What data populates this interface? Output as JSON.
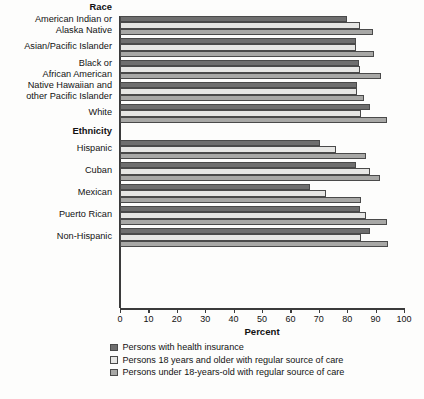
{
  "chart_data": {
    "type": "bar",
    "orientation": "horizontal",
    "title": "",
    "xlabel": "Percent",
    "ylabel": "",
    "xlim": [
      0,
      100
    ],
    "xticks": [
      0,
      10,
      20,
      30,
      40,
      50,
      60,
      70,
      80,
      90,
      100
    ],
    "grid": false,
    "legend_position": "bottom-left",
    "section_headers": [
      "Race",
      "Ethnicity"
    ],
    "categories": [
      "American Indian or\nAlaska Native",
      "Asian/Pacific Islander",
      "Black or\nAfrican American",
      "Native Hawaiian and\nother Pacific Islander",
      "White",
      "Hispanic",
      "Cuban",
      "Mexican",
      "Puerto Rican",
      "Non-Hispanic"
    ],
    "series": [
      {
        "name": "Persons with health insurance",
        "color": "#6e6e6e",
        "values": [
          80,
          83,
          84,
          83.5,
          88,
          70.5,
          83,
          67,
          84.5,
          88
        ]
      },
      {
        "name": "Persons 18 years and older with regular source of care",
        "color": "#e6e6e4",
        "values": [
          84.5,
          83,
          84.5,
          83.5,
          85,
          76,
          88,
          72.5,
          86.5,
          85
        ]
      },
      {
        "name": "Persons under 18-years-old with regular source of care",
        "color": "#a8a8a6",
        "values": [
          89,
          89.5,
          92,
          86,
          94,
          86.5,
          91.5,
          85,
          94,
          94.5
        ]
      }
    ]
  },
  "sections": [
    {
      "header": "Race",
      "rows": [
        {
          "label": "American Indian or\nAlaska Native"
        },
        {
          "label": "Asian/Pacific Islander"
        },
        {
          "label": "Black or\nAfrican American"
        },
        {
          "label": "Native Hawaiian and\nother Pacific Islander"
        },
        {
          "label": "White"
        }
      ]
    },
    {
      "header": "Ethnicity",
      "rows": [
        {
          "label": "Hispanic"
        },
        {
          "label": "Cuban"
        },
        {
          "label": "Mexican"
        },
        {
          "label": "Puerto Rican"
        },
        {
          "label": "Non-Hispanic"
        }
      ]
    }
  ],
  "axis": {
    "title": "Percent",
    "ticks": [
      "0",
      "10",
      "20",
      "30",
      "40",
      "50",
      "60",
      "70",
      "80",
      "90",
      "100"
    ]
  },
  "legend": {
    "items": [
      {
        "label": "Persons with health insurance",
        "swatch": "#6e6e6e"
      },
      {
        "label": "Persons 18 years and older with regular source of care",
        "swatch": "#e6e6e4"
      },
      {
        "label": "Persons under 18-years-old with regular source of care",
        "swatch": "#a8a8a6"
      }
    ]
  }
}
